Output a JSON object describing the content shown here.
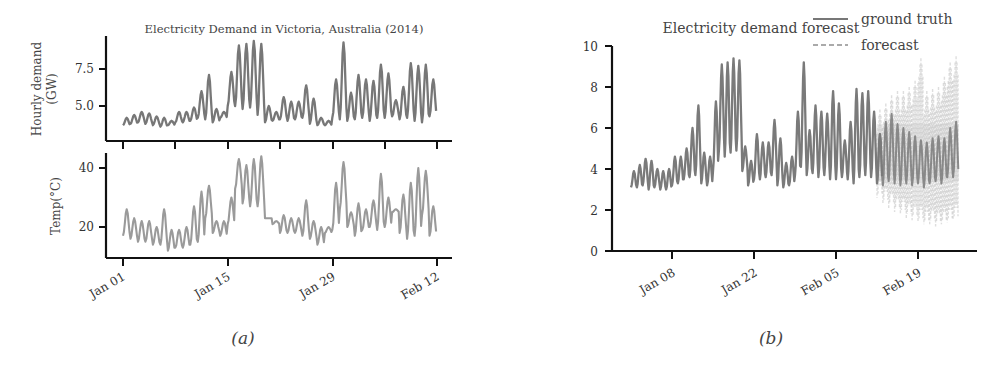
{
  "figure": {
    "caption_a": "(a)",
    "caption_b": "(b)"
  },
  "colors": {
    "demand_line": "#777777",
    "temp_line": "#9a9a9a",
    "ground_truth": "#7a7a7a",
    "forecast": "#b8b8b8",
    "axis": "#111111"
  },
  "chart_data": [
    {
      "id": "panel-a-demand",
      "type": "line",
      "title": "Electricity Demand in Victoria, Australia (2014)",
      "xlabel": "",
      "ylabel": "Hourly demand\n(GW)",
      "ylabel_line1": "Hourly demand",
      "ylabel_line2": "(GW)",
      "yticks": [
        5.0,
        7.5
      ],
      "ytick_labels": [
        "5.0",
        "7.5"
      ],
      "ylim": [
        3.2,
        9.6
      ],
      "xticks": [
        "Jan 01",
        "Jan 08",
        "Jan 15",
        "Jan 22",
        "Jan 29",
        "Feb 05",
        "Feb 12"
      ],
      "grid": false,
      "x_start": "2014-01-01",
      "x_end": "2014-02-12",
      "daily_range_description": "daily oscillation, min/max per day in GW",
      "daily_min": [
        3.7,
        3.8,
        3.9,
        3.8,
        3.7,
        3.6,
        3.7,
        3.9,
        3.9,
        4.0,
        4.2,
        4.1,
        3.9,
        4.2,
        5.0,
        5.0,
        4.8,
        4.9,
        4.4,
        3.9,
        4.0,
        4.1,
        4.0,
        4.1,
        4.2,
        3.8,
        3.7,
        3.7,
        4.2,
        4.1,
        4.0,
        4.1,
        4.2,
        4.0,
        4.2,
        4.2,
        4.3,
        4.1,
        4.2,
        4.0,
        3.9,
        4.3
      ],
      "daily_max": [
        4.2,
        4.4,
        4.6,
        4.5,
        4.3,
        4.2,
        4.0,
        4.6,
        4.6,
        4.9,
        6.0,
        7.1,
        4.8,
        4.6,
        7.3,
        9.1,
        9.2,
        9.4,
        9.2,
        5.0,
        4.6,
        5.6,
        5.3,
        5.3,
        6.4,
        5.5,
        4.2,
        4.0,
        6.8,
        9.3,
        5.9,
        7.1,
        6.8,
        6.7,
        7.8,
        7.2,
        5.4,
        6.3,
        7.9,
        7.7,
        7.8,
        6.8
      ]
    },
    {
      "id": "panel-a-temp",
      "type": "line",
      "title": "",
      "xlabel": "",
      "ylabel": "Temp(°C)",
      "yticks": [
        20,
        40
      ],
      "ytick_labels": [
        "20",
        "40"
      ],
      "ylim": [
        10,
        45
      ],
      "xticks": [
        "Jan 01",
        "Jan 15",
        "Jan 29",
        "Feb 12"
      ],
      "xtick_labels_shown": [
        "Jan 01",
        "Jan 15",
        "Jan 29",
        "Feb 12"
      ],
      "grid": false,
      "daily_min": [
        17,
        16,
        15,
        15,
        14,
        14,
        12,
        13,
        13,
        14,
        15,
        23,
        18,
        17,
        21,
        33,
        28,
        27,
        27,
        23,
        21,
        18,
        18,
        18,
        17,
        16,
        14,
        18,
        19,
        26,
        20,
        17,
        19,
        20,
        19,
        20,
        25,
        18,
        16,
        17,
        24,
        17
      ],
      "daily_max": [
        26,
        23,
        22,
        22,
        20,
        26,
        19,
        19,
        20,
        27,
        32,
        34,
        22,
        22,
        30,
        43,
        41,
        43,
        44,
        23,
        22,
        24,
        23,
        23,
        29,
        22,
        20,
        20,
        35,
        42,
        25,
        28,
        26,
        29,
        38,
        30,
        26,
        31,
        35,
        40,
        39,
        27
      ]
    },
    {
      "id": "panel-b-forecast",
      "type": "line",
      "title": "Electricity demand forecast",
      "xlabel": "",
      "ylabel": "",
      "yticks": [
        0,
        2,
        4,
        6,
        8,
        10
      ],
      "ytick_labels": [
        "0",
        "2",
        "4",
        "6",
        "8",
        "10"
      ],
      "ylim": [
        0,
        10
      ],
      "xticks": [
        "Jan 08",
        "Jan 22",
        "Feb 05",
        "Feb 19"
      ],
      "grid": false,
      "legend": {
        "position": "upper right",
        "entries": [
          {
            "label": "ground truth",
            "style": "solid"
          },
          {
            "label": "forecast",
            "style": "dashed"
          }
        ]
      },
      "x_start": "2014-01-01",
      "x_end": "2014-02-26",
      "forecast_start": "2014-02-12",
      "ground_truth_daily_min": [
        3.1,
        3.1,
        3.2,
        3.0,
        3.1,
        3.0,
        3.0,
        3.2,
        3.3,
        3.5,
        3.6,
        3.7,
        3.3,
        3.2,
        3.9,
        4.9,
        4.6,
        4.8,
        4.9,
        3.9,
        3.2,
        3.5,
        3.5,
        3.6,
        3.7,
        3.2,
        3.1,
        3.2,
        3.7,
        4.1,
        3.7,
        3.8,
        3.6,
        3.7,
        3.5,
        3.5,
        3.6,
        3.5,
        3.3,
        3.6,
        3.7,
        3.6,
        3.3,
        3.2,
        3.4,
        3.3,
        3.2,
        3.3,
        3.2,
        3.3,
        3.1,
        3.3,
        3.4,
        3.3,
        3.6,
        3.6
      ],
      "ground_truth_daily_max": [
        3.9,
        4.2,
        4.5,
        4.4,
        4.0,
        3.9,
        4.0,
        4.6,
        4.6,
        5.0,
        6.0,
        7.1,
        4.8,
        4.6,
        7.3,
        9.1,
        9.2,
        9.4,
        9.3,
        5.1,
        4.4,
        5.7,
        5.3,
        5.3,
        6.4,
        5.5,
        4.3,
        4.6,
        6.8,
        9.2,
        5.9,
        7.1,
        6.8,
        6.7,
        7.8,
        7.2,
        5.4,
        6.3,
        7.9,
        7.7,
        7.8,
        6.8,
        5.7,
        6.3,
        6.7,
        6.2,
        6.0,
        5.8,
        5.6,
        5.4,
        5.3,
        5.5,
        5.6,
        5.5,
        6.0,
        6.3
      ],
      "forecast_band_daily_low": [
        2.6,
        2.3,
        2.1,
        1.9,
        1.8,
        1.6,
        1.5,
        1.4,
        1.3,
        1.3,
        1.2,
        1.3,
        1.4,
        1.5
      ],
      "forecast_band_daily_high": [
        6.9,
        7.2,
        7.6,
        7.8,
        7.8,
        8.0,
        8.3,
        9.4,
        7.8,
        7.9,
        8.0,
        8.5,
        9.2,
        9.5
      ]
    }
  ]
}
